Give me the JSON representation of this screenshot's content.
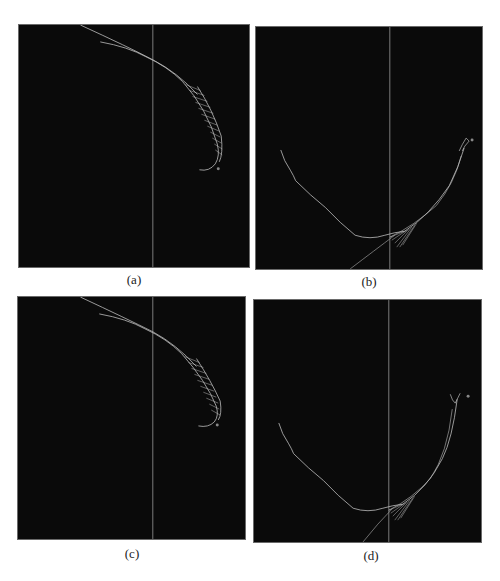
{
  "figure": {
    "panels": [
      {
        "id": "a",
        "label": "(a)",
        "description": "Curved trajectory with hatched segment ending at upper right; vertical reference line"
      },
      {
        "id": "b",
        "label": "(b)",
        "description": "U-shaped trajectory with hatched section near bottom and tip at upper right; vertical reference line"
      },
      {
        "id": "c",
        "label": "(c)",
        "description": "Curved trajectory with hatched segment ending at upper right; vertical reference line"
      },
      {
        "id": "d",
        "label": "(d)",
        "description": "U-shaped trajectory with hatched section near bottom and tip at upper right; vertical reference line"
      }
    ],
    "colors": {
      "background": "#0a0a0a",
      "line": "#bdbdbd",
      "reference_line": "#9a9a9a",
      "page": "#ffffff"
    }
  }
}
